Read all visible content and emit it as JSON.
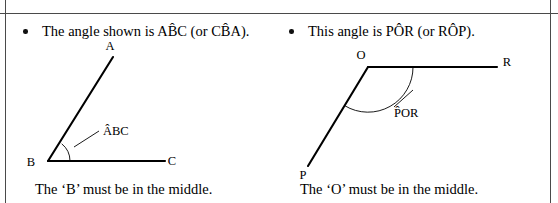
{
  "page": {
    "background_color": "#ffffff",
    "ink_color": "#000000",
    "rule_color": "#4a4a4a"
  },
  "left_column": {
    "bullet_text": "The angle shown is AB̂C (or CB̂A).",
    "caption": "The ‘B’ must be in the middle.",
    "diagram": {
      "type": "angle",
      "vertex_label": "B",
      "ray_labels": [
        "A",
        "C"
      ],
      "annotation_label": "AB̂C",
      "vertex_point": [
        48,
        161
      ],
      "ray_a_point": [
        113,
        57
      ],
      "ray_c_point": [
        165,
        161
      ],
      "arc_radius": 22,
      "leader_from": [
        74,
        145
      ],
      "leader_to": [
        98,
        131
      ],
      "label_position": [
        101,
        135
      ],
      "label_a_position": [
        110,
        48
      ],
      "label_b_position": [
        29,
        166
      ],
      "label_c_position": [
        170,
        165
      ]
    }
  },
  "right_column": {
    "bullet_text": "This angle is PÔR (or RÔP).",
    "caption": "The ‘O’ must be in the middle.",
    "diagram": {
      "type": "angle",
      "vertex_label": "O",
      "ray_labels": [
        "P",
        "R"
      ],
      "annotation_label": "PÔR",
      "vertex_point": [
        368,
        67
      ],
      "ray_r_point": [
        497,
        67
      ],
      "ray_p_point": [
        308,
        166
      ],
      "arc_radius": 45,
      "leader_from": [
        396,
        104
      ],
      "leader_to": [
        412,
        92
      ],
      "label_position": [
        394,
        116
      ],
      "label_o_position": [
        359,
        58
      ],
      "label_p_position": [
        300,
        178
      ],
      "label_r_position": [
        504,
        66
      ]
    }
  }
}
